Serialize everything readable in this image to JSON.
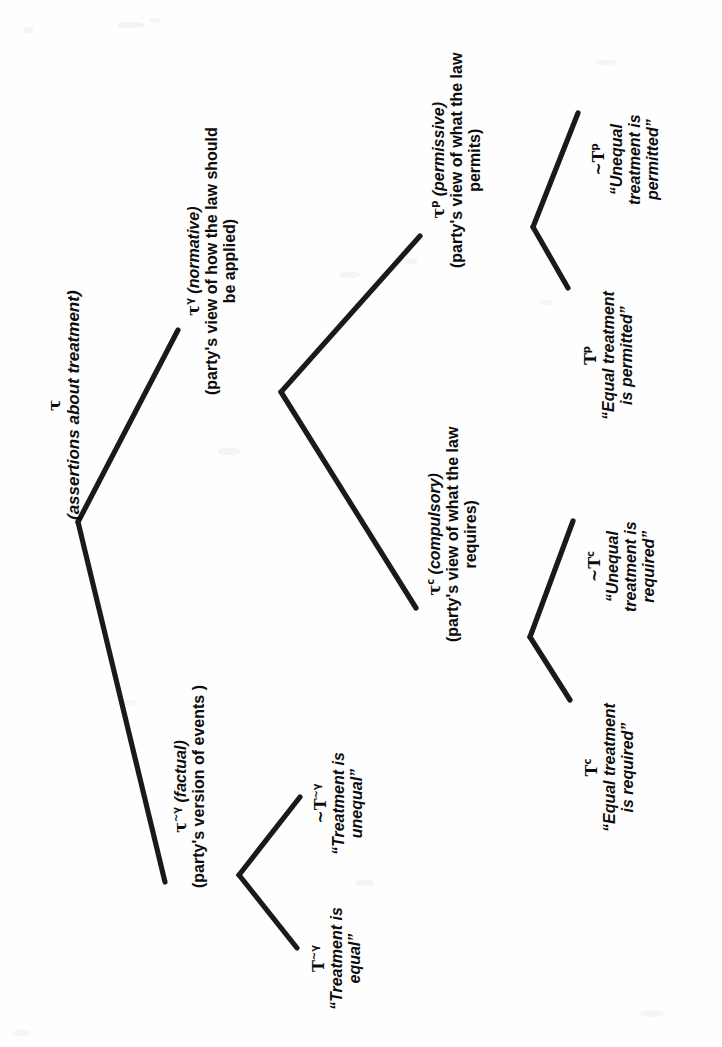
{
  "figure": {
    "type": "tree-diagram",
    "orientation": "rotated-90-counterclockwise",
    "background_color": "#fefefe",
    "line_color": "#1a1a1a",
    "text_color": "#0d0d0d"
  },
  "nodes": {
    "root": {
      "symbol": "τ",
      "superscript": "",
      "gloss": "(assertions about treatment)"
    },
    "factual": {
      "symbol": "τ",
      "superscript": "~γ",
      "kind": "(factual)",
      "gloss_line1": "(party's version of events )"
    },
    "normative": {
      "symbol": "τ",
      "superscript": "γ",
      "kind": "(normative)",
      "gloss_line1": "(party's view of how the law should",
      "gloss_line2": "be applied)"
    },
    "compulsory": {
      "symbol": "τ",
      "superscript": "c",
      "kind": "(compulsory)",
      "gloss_line1": "(party's view of what the law",
      "gloss_line2": "requires)"
    },
    "permissive": {
      "symbol": "τ",
      "superscript": "p",
      "kind": "(permissive)",
      "gloss_line1": "(party's view of what the law",
      "gloss_line2": "permits)"
    }
  },
  "leaves": {
    "t_factual_pos": {
      "symbol": "T",
      "superscript": "~γ",
      "quote_line1": "“Treatment is",
      "quote_line2": "equal”"
    },
    "t_factual_neg": {
      "symbol": "~T",
      "superscript": "~γ",
      "quote_line1": "“Treatment is",
      "quote_line2": "unequal”"
    },
    "t_compulsory_pos": {
      "symbol": "T",
      "superscript": "c",
      "quote_line1": "“Equal treatment",
      "quote_line2": "is required”"
    },
    "t_compulsory_neg": {
      "symbol": "~T",
      "superscript": "c",
      "quote_line1": "“Unequal",
      "quote_line2": "treatment is",
      "quote_line3": "required”"
    },
    "t_permissive_pos": {
      "symbol": "T",
      "superscript": "p",
      "quote_line1": "“Equal treatment",
      "quote_line2": "is permitted”"
    },
    "t_permissive_neg": {
      "symbol": "~T",
      "superscript": "p",
      "quote_line1": "“Unequal",
      "quote_line2": "treatment is",
      "quote_line3": "permitted”"
    }
  }
}
